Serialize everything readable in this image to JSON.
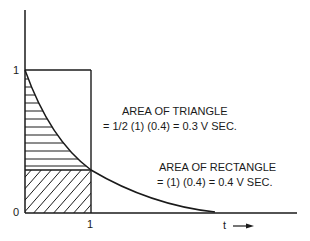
{
  "diagram": {
    "type": "exponential-decay-area-comparison",
    "y_axis": {
      "tick_top": "1",
      "tick_origin": "0"
    },
    "x_axis": {
      "tick": "1",
      "label": "t",
      "arrow": "right-arrow"
    },
    "annotations": {
      "triangle": {
        "title": "AREA OF TRIANGLE",
        "formula": "= 1/2 (1) (0.4) = 0.3 V SEC."
      },
      "rectangle": {
        "title": "AREA OF RECTANGLE",
        "formula": "= (1) (0.4) = 0.4 V SEC."
      }
    },
    "colors": {
      "line": "#1a1a1a",
      "background": "#ffffff"
    }
  }
}
